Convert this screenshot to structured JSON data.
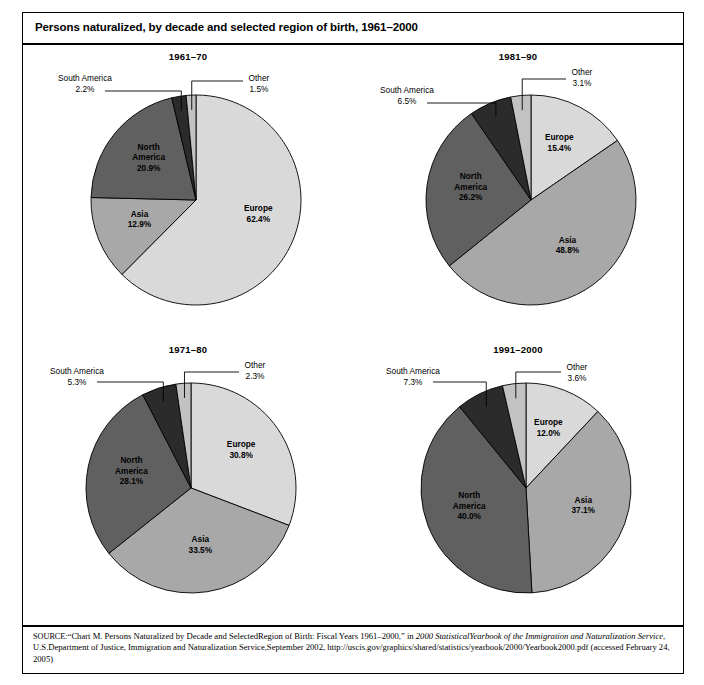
{
  "figure": {
    "title": "Persons naturalized, by decade and selected region of birth, 1961–2000"
  },
  "source": {
    "label": "SOURCE:",
    "line1_pre": "“Chart M. Persons Naturalized by Decade and SelectedRegion of Birth: Fiscal Years 1961–2000,” in ",
    "line1_italic": "2000 StatisticalYearbook of the Immigration and Naturalization Service",
    "line2": ", U.S.Department of Justice, Immigration and Naturalization Service,September 2002, http://uscis.gov/graphics/shared/statistics/yearbook/2000/Yearbook2000.pdf  (accessed February 24, 2005)"
  },
  "colors": {
    "europe": "#d9d9d9",
    "asia": "#a8a8a8",
    "north_america": "#606060",
    "south_america": "#2b2b2b",
    "other": "#c2c2c2",
    "outline": "#000000"
  },
  "chart_data": [
    {
      "type": "pie",
      "title": "1961–70",
      "categories": [
        "Europe",
        "Asia",
        "North America",
        "South America",
        "Other"
      ],
      "values": [
        62.4,
        12.9,
        20.9,
        2.2,
        1.5
      ],
      "labels": [
        "62.4%",
        "12.9%",
        "20.9%",
        "2.2%",
        "1.5%"
      ],
      "label_placement": [
        "inside",
        "inside",
        "inside",
        "outside",
        "outside"
      ]
    },
    {
      "type": "pie",
      "title": "1981–90",
      "categories": [
        "Europe",
        "Asia",
        "North America",
        "South America",
        "Other"
      ],
      "values": [
        15.4,
        48.8,
        26.2,
        6.5,
        3.1
      ],
      "labels": [
        "15.4%",
        "48.8%",
        "26.2%",
        "6.5%",
        "3.1%"
      ],
      "label_placement": [
        "inside",
        "inside",
        "inside",
        "outside",
        "outside"
      ]
    },
    {
      "type": "pie",
      "title": "1971–80",
      "categories": [
        "Europe",
        "Asia",
        "North America",
        "South America",
        "Other"
      ],
      "values": [
        30.8,
        33.5,
        28.1,
        5.3,
        2.3
      ],
      "labels": [
        "30.8%",
        "33.5%",
        "28.1%",
        "5.3%",
        "2.3%"
      ],
      "label_placement": [
        "inside",
        "inside",
        "inside",
        "outside",
        "outside"
      ]
    },
    {
      "type": "pie",
      "title": "1991–2000",
      "categories": [
        "Europe",
        "Asia",
        "North America",
        "South America",
        "Other"
      ],
      "values": [
        12.0,
        37.1,
        40.0,
        7.3,
        3.6
      ],
      "labels": [
        "12.0%",
        "37.1%",
        "40.0%",
        "7.3%",
        "3.6%"
      ],
      "label_placement": [
        "inside",
        "inside",
        "inside",
        "outside",
        "outside"
      ]
    }
  ],
  "panel_labels": [
    {
      "europe_name": "Europe",
      "europe_pct": "62.4%",
      "asia_name": "Asia",
      "asia_pct": "12.9%",
      "na_name1": "North",
      "na_name2": "America",
      "na_pct": "20.9%",
      "sa_name": "South America",
      "sa_pct": "2.2%",
      "other_name": "Other",
      "other_pct": "1.5%"
    },
    {
      "europe_name": "Europe",
      "europe_pct": "15.4%",
      "asia_name": "Asia",
      "asia_pct": "48.8%",
      "na_name1": "North",
      "na_name2": "America",
      "na_pct": "26.2%",
      "sa_name": "South America",
      "sa_pct": "6.5%",
      "other_name": "Other",
      "other_pct": "3.1%"
    },
    {
      "europe_name": "Europe",
      "europe_pct": "30.8%",
      "asia_name": "Asia",
      "asia_pct": "33.5%",
      "na_name1": "North",
      "na_name2": "America",
      "na_pct": "28.1%",
      "sa_name": "South America",
      "sa_pct": "5.3%",
      "other_name": "Other",
      "other_pct": "2.3%"
    },
    {
      "europe_name": "Europe",
      "europe_pct": "12.0%",
      "asia_name": "Asia",
      "asia_pct": "37.1%",
      "na_name1": "North",
      "na_name2": "America",
      "na_pct": "40.0%",
      "sa_name": "South America",
      "sa_pct": "7.3%",
      "other_name": "Other",
      "other_pct": "3.6%"
    }
  ]
}
